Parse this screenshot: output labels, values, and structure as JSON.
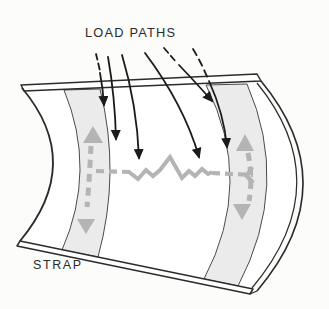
{
  "figure": {
    "load_paths_label": "LOAD PATHS",
    "strap_label": "STRAP",
    "load_path_arrow_count": 6,
    "strap_count": 2
  },
  "colors": {
    "background": "#fcfcfa",
    "outline": "#2b2b2b",
    "panel_fill": "#ffffff",
    "band_fill": "#ebebeb",
    "band_edge": "#4b4b4b",
    "flow_gray": "#b4b4b4",
    "arrow_black": "#1b1b1b",
    "label_color": "#2b2b2b"
  }
}
